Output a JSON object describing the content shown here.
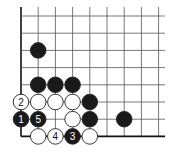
{
  "diagram": {
    "type": "go-board-corner",
    "corner": "bottom-left",
    "grid": {
      "origin_x": 21,
      "origin_y": 16,
      "spacing_x": 17.2,
      "spacing_y": 17.2,
      "cols": 9,
      "rows": 8,
      "line_color": "#555555",
      "edge_color": "#111111"
    },
    "colors": {
      "black": "#1a1a1a",
      "white": "#ffffff",
      "stone_outline": "#222222"
    },
    "stones": [
      {
        "color": "black",
        "col": 1,
        "row": 2,
        "label": ""
      },
      {
        "color": "black",
        "col": 1,
        "row": 4,
        "label": ""
      },
      {
        "color": "black",
        "col": 2,
        "row": 4,
        "label": ""
      },
      {
        "color": "black",
        "col": 3,
        "row": 4,
        "label": ""
      },
      {
        "color": "white",
        "col": 0,
        "row": 5,
        "label": "2"
      },
      {
        "color": "white",
        "col": 1,
        "row": 5,
        "label": ""
      },
      {
        "color": "white",
        "col": 2,
        "row": 5,
        "label": ""
      },
      {
        "color": "white",
        "col": 3,
        "row": 5,
        "label": ""
      },
      {
        "color": "black",
        "col": 4,
        "row": 5,
        "label": ""
      },
      {
        "color": "black",
        "col": 0,
        "row": 6,
        "label": "1"
      },
      {
        "color": "black",
        "col": 1,
        "row": 6,
        "label": "5"
      },
      {
        "color": "white",
        "col": 3,
        "row": 6,
        "label": ""
      },
      {
        "color": "black",
        "col": 4,
        "row": 6,
        "label": ""
      },
      {
        "color": "black",
        "col": 6,
        "row": 6,
        "label": ""
      },
      {
        "color": "white",
        "col": 1,
        "row": 7,
        "label": ""
      },
      {
        "color": "white",
        "col": 2,
        "row": 7,
        "label": "4"
      },
      {
        "color": "black",
        "col": 3,
        "row": 7,
        "label": "3"
      },
      {
        "color": "white",
        "col": 4,
        "row": 7,
        "label": ""
      }
    ]
  }
}
